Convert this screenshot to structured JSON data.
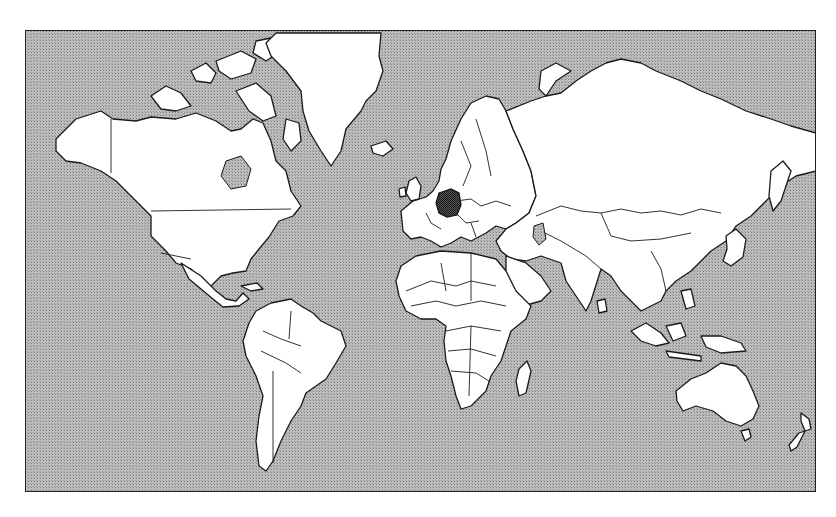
{
  "map": {
    "type": "world-political-outline",
    "projection": "Mercator",
    "highlighted_country": "Germany",
    "colors": {
      "ocean": "#a9a9a9",
      "land": "#ffffff",
      "border": "#1a1a1a",
      "highlight": "#3a3a3a"
    },
    "regions": [
      {
        "name": "North America"
      },
      {
        "name": "Greenland"
      },
      {
        "name": "South America"
      },
      {
        "name": "Europe"
      },
      {
        "name": "Africa"
      },
      {
        "name": "Asia"
      },
      {
        "name": "Australia"
      },
      {
        "name": "New Zealand"
      }
    ]
  }
}
